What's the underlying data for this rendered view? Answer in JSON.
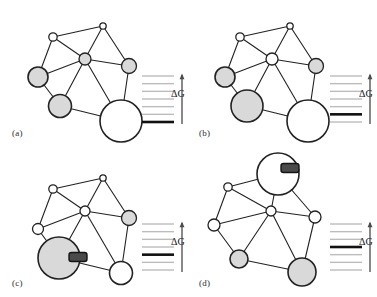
{
  "figure": {
    "caption_labels": [
      "(a)",
      "(b)",
      "(c)",
      "(d)"
    ],
    "energy_axis_label": "ΔG",
    "colors": {
      "node_outline": "#222222",
      "node_fill_shaded": "#d9d9d9",
      "node_fill_empty": "#ffffff",
      "edge": "#222222",
      "ligand_fill": "#4a4a4a",
      "ladder_level": "#bcbcbc",
      "ladder_ground": "#111111",
      "arrow": "#4a4a4a",
      "background": "#ffffff"
    }
  },
  "panels": [
    {
      "id": "a",
      "label": "(a)",
      "dg_label": "ΔG",
      "ligand": null,
      "ladder": {
        "levels": 7,
        "ground_index": 6,
        "ground_level_label": "ground-state-energy-bar",
        "arrow_label": "ΔG"
      },
      "nodes": [
        {
          "name": "node-top",
          "cx": 95,
          "cy": 22,
          "r": 3.2,
          "fill": "empty"
        },
        {
          "name": "node-upper-left",
          "cx": 45,
          "cy": 33,
          "r": 4.2,
          "fill": "empty"
        },
        {
          "name": "node-center",
          "cx": 77,
          "cy": 55,
          "r": 6.0,
          "fill": "shaded"
        },
        {
          "name": "node-right",
          "cx": 121,
          "cy": 62,
          "r": 7.5,
          "fill": "shaded"
        },
        {
          "name": "node-left",
          "cx": 30,
          "cy": 73,
          "r": 10.0,
          "fill": "shaded"
        },
        {
          "name": "node-lower-left",
          "cx": 52,
          "cy": 102,
          "r": 11.5,
          "fill": "shaded"
        },
        {
          "name": "node-big-bottom",
          "cx": 113,
          "cy": 117,
          "r": 21.0,
          "fill": "empty"
        }
      ],
      "edges": [
        [
          "node-top",
          "node-upper-left"
        ],
        [
          "node-top",
          "node-center"
        ],
        [
          "node-top",
          "node-right"
        ],
        [
          "node-upper-left",
          "node-center"
        ],
        [
          "node-upper-left",
          "node-left"
        ],
        [
          "node-center",
          "node-right"
        ],
        [
          "node-center",
          "node-left"
        ],
        [
          "node-center",
          "node-lower-left"
        ],
        [
          "node-center",
          "node-big-bottom"
        ],
        [
          "node-left",
          "node-lower-left"
        ],
        [
          "node-right",
          "node-big-bottom"
        ],
        [
          "node-lower-left",
          "node-big-bottom"
        ]
      ]
    },
    {
      "id": "b",
      "label": "(b)",
      "dg_label": "ΔG",
      "ligand": null,
      "ladder": {
        "levels": 7,
        "ground_index": 5,
        "ground_level_label": "ground-state-energy-bar",
        "arrow_label": "ΔG"
      },
      "nodes": [
        {
          "name": "node-top",
          "cx": 95,
          "cy": 22,
          "r": 3.2,
          "fill": "empty"
        },
        {
          "name": "node-upper-left",
          "cx": 45,
          "cy": 33,
          "r": 4.2,
          "fill": "empty"
        },
        {
          "name": "node-center",
          "cx": 77,
          "cy": 55,
          "r": 6.0,
          "fill": "empty"
        },
        {
          "name": "node-right",
          "cx": 121,
          "cy": 62,
          "r": 7.5,
          "fill": "shaded"
        },
        {
          "name": "node-left",
          "cx": 30,
          "cy": 73,
          "r": 10.0,
          "fill": "shaded"
        },
        {
          "name": "node-lower-left",
          "cx": 52,
          "cy": 102,
          "r": 16.0,
          "fill": "shaded"
        },
        {
          "name": "node-big-bottom",
          "cx": 113,
          "cy": 117,
          "r": 21.0,
          "fill": "empty"
        }
      ],
      "edges": [
        [
          "node-top",
          "node-upper-left"
        ],
        [
          "node-top",
          "node-center"
        ],
        [
          "node-top",
          "node-right"
        ],
        [
          "node-upper-left",
          "node-center"
        ],
        [
          "node-upper-left",
          "node-left"
        ],
        [
          "node-center",
          "node-right"
        ],
        [
          "node-center",
          "node-left"
        ],
        [
          "node-center",
          "node-lower-left"
        ],
        [
          "node-center",
          "node-big-bottom"
        ],
        [
          "node-left",
          "node-lower-left"
        ],
        [
          "node-right",
          "node-big-bottom"
        ],
        [
          "node-lower-left",
          "node-big-bottom"
        ]
      ]
    },
    {
      "id": "c",
      "label": "(c)",
      "dg_label": "ΔG",
      "ligand": {
        "name": "ligand-marker",
        "cx": 70,
        "cy": 101,
        "w": 18,
        "h": 9
      },
      "ladder": {
        "levels": 7,
        "ground_index": 4,
        "ground_level_label": "ground-state-energy-bar",
        "arrow_label": "ΔG"
      },
      "nodes": [
        {
          "name": "node-top",
          "cx": 95,
          "cy": 22,
          "r": 3.2,
          "fill": "empty"
        },
        {
          "name": "node-upper-left",
          "cx": 45,
          "cy": 33,
          "r": 4.2,
          "fill": "empty"
        },
        {
          "name": "node-center",
          "cx": 77,
          "cy": 55,
          "r": 5.0,
          "fill": "empty"
        },
        {
          "name": "node-right",
          "cx": 121,
          "cy": 62,
          "r": 7.5,
          "fill": "shaded"
        },
        {
          "name": "node-left",
          "cx": 30,
          "cy": 73,
          "r": 5.5,
          "fill": "empty"
        },
        {
          "name": "node-lower-left",
          "cx": 51,
          "cy": 102,
          "r": 21.0,
          "fill": "shaded"
        },
        {
          "name": "node-big-bottom",
          "cx": 113,
          "cy": 117,
          "r": 11.5,
          "fill": "empty"
        }
      ],
      "edges": [
        [
          "node-top",
          "node-upper-left"
        ],
        [
          "node-top",
          "node-center"
        ],
        [
          "node-top",
          "node-right"
        ],
        [
          "node-upper-left",
          "node-center"
        ],
        [
          "node-upper-left",
          "node-left"
        ],
        [
          "node-center",
          "node-right"
        ],
        [
          "node-center",
          "node-left"
        ],
        [
          "node-center",
          "node-lower-left"
        ],
        [
          "node-center",
          "node-big-bottom"
        ],
        [
          "node-left",
          "node-lower-left"
        ],
        [
          "node-right",
          "node-big-bottom"
        ],
        [
          "node-lower-left",
          "node-big-bottom"
        ]
      ]
    },
    {
      "id": "d",
      "label": "(d)",
      "dg_label": "ΔG",
      "ligand": {
        "name": "ligand-marker",
        "cx": 95,
        "cy": 16,
        "w": 18,
        "h": 9
      },
      "ladder": {
        "levels": 7,
        "ground_index": 3,
        "ground_level_label": "ground-state-energy-bar",
        "arrow_label": "ΔG"
      },
      "nodes": [
        {
          "name": "node-top",
          "cx": 83,
          "cy": 22,
          "r": 21.0,
          "fill": "empty"
        },
        {
          "name": "node-upper-left",
          "cx": 33,
          "cy": 35,
          "r": 4.2,
          "fill": "empty"
        },
        {
          "name": "node-center",
          "cx": 76,
          "cy": 59,
          "r": 5.0,
          "fill": "empty"
        },
        {
          "name": "node-right",
          "cx": 120,
          "cy": 65,
          "r": 6.0,
          "fill": "empty"
        },
        {
          "name": "node-left",
          "cx": 19,
          "cy": 73,
          "r": 6.0,
          "fill": "empty"
        },
        {
          "name": "node-lower-left",
          "cx": 44,
          "cy": 107,
          "r": 9.0,
          "fill": "shaded"
        },
        {
          "name": "node-big-bottom",
          "cx": 107,
          "cy": 120,
          "r": 14.0,
          "fill": "shaded"
        }
      ],
      "edges": [
        [
          "node-top",
          "node-upper-left"
        ],
        [
          "node-top",
          "node-center"
        ],
        [
          "node-top",
          "node-right"
        ],
        [
          "node-upper-left",
          "node-center"
        ],
        [
          "node-upper-left",
          "node-left"
        ],
        [
          "node-center",
          "node-right"
        ],
        [
          "node-center",
          "node-left"
        ],
        [
          "node-center",
          "node-lower-left"
        ],
        [
          "node-center",
          "node-big-bottom"
        ],
        [
          "node-left",
          "node-lower-left"
        ],
        [
          "node-right",
          "node-big-bottom"
        ],
        [
          "node-lower-left",
          "node-big-bottom"
        ]
      ]
    }
  ]
}
